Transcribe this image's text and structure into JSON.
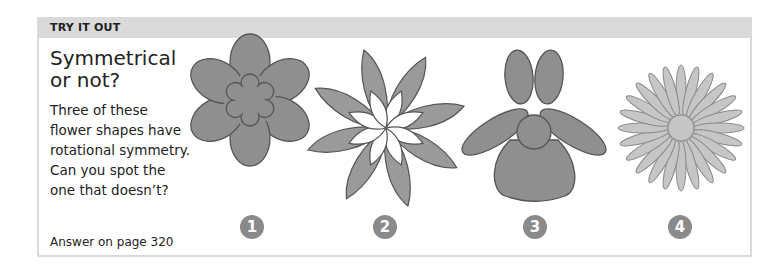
{
  "panel": {
    "header": "TRY IT OUT",
    "title_line1": "Symmetrical",
    "title_line2": "or not?",
    "description": [
      "Three of these",
      "flower shapes have",
      "rotational symmetry.",
      "Can you spot the",
      "one that doesn’t?"
    ],
    "answer": "Answer on page 320"
  },
  "flowers": [
    {
      "number": "1",
      "name": "six-petal-flower"
    },
    {
      "number": "2",
      "name": "eight-pointed-star-flower"
    },
    {
      "number": "3",
      "name": "asymmetric-flower"
    },
    {
      "number": "4",
      "name": "daisy-flower"
    }
  ],
  "colors": {
    "header_bg": "#dadada",
    "shape_fill": "#8f8f8f",
    "daisy_fill": "#c6c6c6",
    "number_badge": "#8a8a8a"
  }
}
